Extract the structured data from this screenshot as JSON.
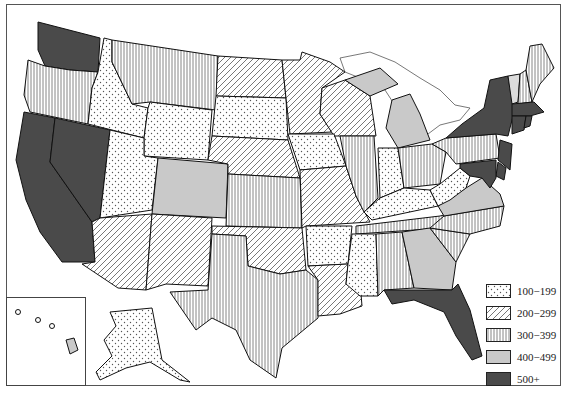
{
  "map": {
    "type": "choropleth",
    "region": "United States",
    "legend": [
      {
        "label": "100−199",
        "pattern": "dots",
        "color": "#ffffff"
      },
      {
        "label": "200−299",
        "pattern": "diagonal",
        "color": "#ffffff"
      },
      {
        "label": "300−399",
        "pattern": "vertical",
        "color": "#ffffff"
      },
      {
        "label": "400−499",
        "pattern": "solid",
        "color": "#c9c9c9"
      },
      {
        "label": "500+",
        "pattern": "solid",
        "color": "#4a4a4a"
      }
    ],
    "states": {
      "WA": "500+",
      "CA": "500+",
      "NV": "500+",
      "NY": "500+",
      "NJ": "500+",
      "MA": "500+",
      "CT": "500+",
      "RI": "500+",
      "DE": "500+",
      "MD": "500+",
      "FL": "500+",
      "CO": "400−499",
      "MI": "400−499",
      "GA": "400−499",
      "VA": "400−499",
      "NH": "400−499",
      "HI": "400−499",
      "OR": "300−399",
      "MT": "300−399",
      "TX": "300−399",
      "KS": "300−399",
      "IL": "300−399",
      "OH": "300−399",
      "PA": "300−399",
      "TN": "300−399",
      "NC": "300−399",
      "SC": "300−399",
      "AL": "300−399",
      "ME": "300−399",
      "VT": "300−399",
      "AZ": "200−299",
      "NM": "200−299",
      "ND": "200−299",
      "MN": "200−299",
      "WI": "200−299",
      "NE": "200−299",
      "MO": "200−299",
      "OK": "200−299",
      "LA": "200−299",
      "ID": "100−199",
      "WY": "100−199",
      "UT": "100−199",
      "SD": "100−199",
      "IA": "100−199",
      "AR": "100−199",
      "MS": "100−199",
      "IN": "100−199",
      "KY": "100−199",
      "WV": "100−199",
      "AK": "100−199"
    }
  }
}
